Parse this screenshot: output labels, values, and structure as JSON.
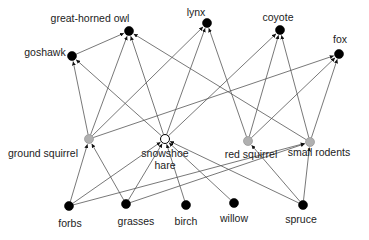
{
  "diagram": {
    "type": "food-web",
    "colors": {
      "predator": "#000000",
      "producer": "#000000",
      "herbivore": "#b0b0b0",
      "keystone": "#ffffff",
      "edge": "#555555"
    },
    "nodes": [
      {
        "id": "great-horned-owl",
        "label": "great-horned owl",
        "x": 129,
        "y": 31,
        "kind": "predator",
        "lx": 90,
        "ly": 22,
        "anchor": "middle"
      },
      {
        "id": "lynx",
        "label": "lynx",
        "x": 207,
        "y": 23,
        "kind": "predator",
        "lx": 196,
        "ly": 16,
        "anchor": "middle"
      },
      {
        "id": "coyote",
        "label": "coyote",
        "x": 280,
        "y": 30,
        "kind": "predator",
        "lx": 278,
        "ly": 21,
        "anchor": "middle"
      },
      {
        "id": "fox",
        "label": "fox",
        "x": 339,
        "y": 54,
        "kind": "predator",
        "lx": 340,
        "ly": 43,
        "anchor": "middle"
      },
      {
        "id": "goshawk",
        "label": "goshawk",
        "x": 72,
        "y": 56,
        "kind": "predator",
        "lx": 45,
        "ly": 56,
        "anchor": "middle"
      },
      {
        "id": "ground-squirrel",
        "label": "ground squirrel",
        "x": 89,
        "y": 139,
        "kind": "herbivore",
        "lx": 43,
        "ly": 157,
        "anchor": "middle"
      },
      {
        "id": "snowshoe-hare",
        "label": "snowshoe",
        "label2": "hare",
        "x": 165,
        "y": 139,
        "kind": "keystone",
        "lx": 165,
        "ly": 157,
        "anchor": "middle"
      },
      {
        "id": "red-squirrel",
        "label": "red squirrel",
        "x": 248,
        "y": 141,
        "kind": "herbivore",
        "lx": 251,
        "ly": 158,
        "anchor": "middle"
      },
      {
        "id": "small-rodents",
        "label": "small rodents",
        "x": 310,
        "y": 142,
        "kind": "herbivore",
        "lx": 319,
        "ly": 156,
        "anchor": "middle"
      },
      {
        "id": "forbs",
        "label": "forbs",
        "x": 69,
        "y": 206,
        "kind": "producer",
        "lx": 70,
        "ly": 227,
        "anchor": "middle"
      },
      {
        "id": "grasses",
        "label": "grasses",
        "x": 126,
        "y": 204,
        "kind": "producer",
        "lx": 136,
        "ly": 225,
        "anchor": "middle"
      },
      {
        "id": "birch",
        "label": "birch",
        "x": 186,
        "y": 205,
        "kind": "producer",
        "lx": 186,
        "ly": 225,
        "anchor": "middle"
      },
      {
        "id": "willow",
        "label": "willow",
        "x": 234,
        "y": 203,
        "kind": "producer",
        "lx": 234,
        "ly": 222,
        "anchor": "middle"
      },
      {
        "id": "spruce",
        "label": "spruce",
        "x": 303,
        "y": 205,
        "kind": "producer",
        "lx": 301,
        "ly": 223,
        "anchor": "middle"
      }
    ],
    "edges": [
      {
        "from": "forbs",
        "to": "ground-squirrel"
      },
      {
        "from": "forbs",
        "to": "snowshoe-hare"
      },
      {
        "from": "forbs",
        "to": "small-rodents"
      },
      {
        "from": "grasses",
        "to": "ground-squirrel"
      },
      {
        "from": "grasses",
        "to": "snowshoe-hare"
      },
      {
        "from": "grasses",
        "to": "small-rodents"
      },
      {
        "from": "birch",
        "to": "snowshoe-hare"
      },
      {
        "from": "willow",
        "to": "snowshoe-hare"
      },
      {
        "from": "spruce",
        "to": "snowshoe-hare"
      },
      {
        "from": "spruce",
        "to": "red-squirrel"
      },
      {
        "from": "spruce",
        "to": "small-rodents"
      },
      {
        "from": "ground-squirrel",
        "to": "goshawk"
      },
      {
        "from": "ground-squirrel",
        "to": "great-horned-owl"
      },
      {
        "from": "ground-squirrel",
        "to": "lynx"
      },
      {
        "from": "ground-squirrel",
        "to": "fox"
      },
      {
        "from": "snowshoe-hare",
        "to": "goshawk"
      },
      {
        "from": "snowshoe-hare",
        "to": "great-horned-owl"
      },
      {
        "from": "snowshoe-hare",
        "to": "lynx"
      },
      {
        "from": "snowshoe-hare",
        "to": "coyote"
      },
      {
        "from": "red-squirrel",
        "to": "lynx"
      },
      {
        "from": "red-squirrel",
        "to": "coyote"
      },
      {
        "from": "red-squirrel",
        "to": "fox"
      },
      {
        "from": "small-rodents",
        "to": "great-horned-owl"
      },
      {
        "from": "small-rodents",
        "to": "coyote"
      },
      {
        "from": "small-rodents",
        "to": "fox"
      },
      {
        "from": "goshawk",
        "to": "great-horned-owl"
      }
    ]
  }
}
